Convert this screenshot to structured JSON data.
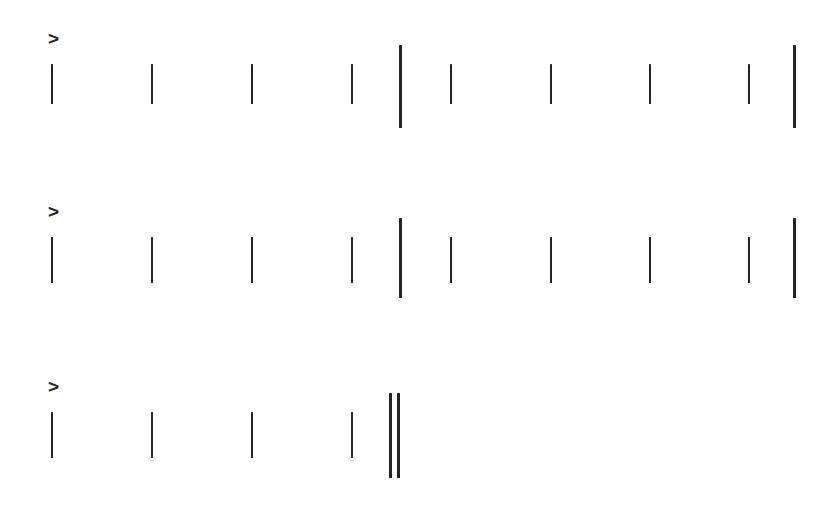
{
  "page": {
    "width": 839,
    "height": 511,
    "background_color": "#ffffff",
    "ink_color": "#242427"
  },
  "marker": {
    "glyph": ">",
    "semantic_name": "prompt-marker",
    "size_px": 19
  },
  "rows": [
    {
      "id": "row-1",
      "marker_text": ">",
      "marker": {
        "x": 48,
        "y": 29,
        "size": 19
      },
      "marks": [
        {
          "kind": "tick",
          "x": 51,
          "y": 64,
          "height": 40
        },
        {
          "kind": "tick",
          "x": 151,
          "y": 64,
          "height": 40
        },
        {
          "kind": "tick",
          "x": 251,
          "y": 64,
          "height": 40
        },
        {
          "kind": "tick",
          "x": 351,
          "y": 64,
          "height": 40
        },
        {
          "kind": "rule",
          "x": 399,
          "y": 45,
          "height": 83
        },
        {
          "kind": "tick",
          "x": 450,
          "y": 64,
          "height": 40
        },
        {
          "kind": "tick",
          "x": 550,
          "y": 64,
          "height": 40
        },
        {
          "kind": "tick",
          "x": 649,
          "y": 64,
          "height": 40
        },
        {
          "kind": "tick",
          "x": 748,
          "y": 64,
          "height": 40
        },
        {
          "kind": "rule",
          "x": 793,
          "y": 45,
          "height": 83
        }
      ]
    },
    {
      "id": "row-2",
      "marker_text": ">",
      "marker": {
        "x": 48,
        "y": 202,
        "size": 19
      },
      "marks": [
        {
          "kind": "tick",
          "x": 51,
          "y": 237,
          "height": 46
        },
        {
          "kind": "tick",
          "x": 151,
          "y": 237,
          "height": 46
        },
        {
          "kind": "tick",
          "x": 251,
          "y": 237,
          "height": 46
        },
        {
          "kind": "tick",
          "x": 351,
          "y": 237,
          "height": 46
        },
        {
          "kind": "rule",
          "x": 399,
          "y": 218,
          "height": 80
        },
        {
          "kind": "tick",
          "x": 450,
          "y": 237,
          "height": 46
        },
        {
          "kind": "tick",
          "x": 550,
          "y": 237,
          "height": 46
        },
        {
          "kind": "tick",
          "x": 649,
          "y": 237,
          "height": 46
        },
        {
          "kind": "tick",
          "x": 748,
          "y": 237,
          "height": 46
        },
        {
          "kind": "rule",
          "x": 793,
          "y": 218,
          "height": 80
        }
      ]
    },
    {
      "id": "row-3",
      "marker_text": ">",
      "marker": {
        "x": 48,
        "y": 377,
        "size": 19
      },
      "marks": [
        {
          "kind": "tick",
          "x": 51,
          "y": 412,
          "height": 46
        },
        {
          "kind": "tick",
          "x": 151,
          "y": 412,
          "height": 46
        },
        {
          "kind": "tick",
          "x": 251,
          "y": 412,
          "height": 46
        },
        {
          "kind": "tick",
          "x": 351,
          "y": 412,
          "height": 46
        },
        {
          "kind": "rule-pair",
          "x": 389,
          "y": 393,
          "height": 85
        },
        {
          "kind": "rule-pair",
          "x": 397,
          "y": 393,
          "height": 85
        }
      ]
    }
  ]
}
